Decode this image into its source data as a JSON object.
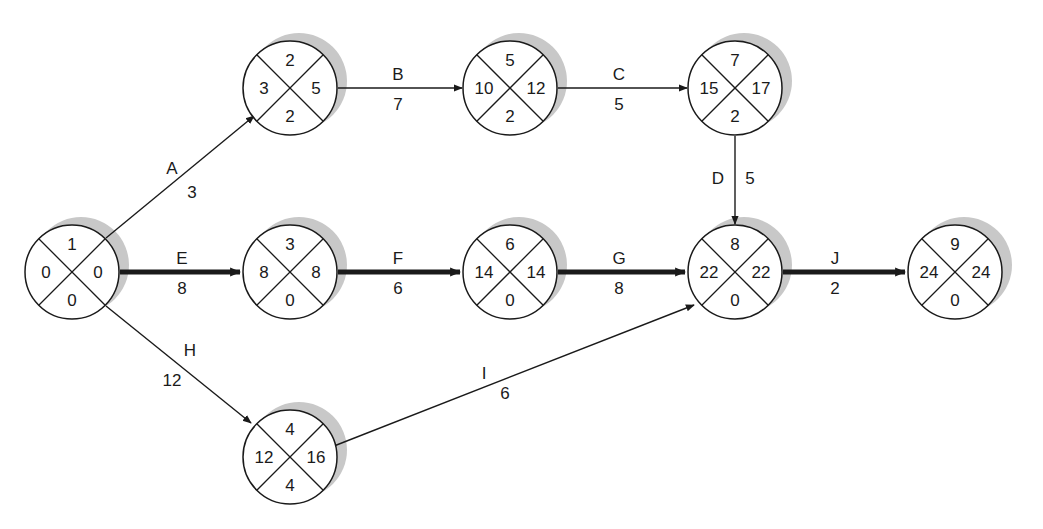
{
  "diagram": {
    "type": "activity-on-arrow network (critical path)",
    "colors": {
      "stroke": "#1a1a1a",
      "shadow": "#c8c8c8",
      "fill": "#ffffff"
    },
    "node_radius": 47,
    "nodes": [
      {
        "id": "1",
        "cx": 72,
        "cy": 272,
        "top": "1",
        "left": "0",
        "right": "0",
        "bottom": "0"
      },
      {
        "id": "2",
        "cx": 290,
        "cy": 88,
        "top": "2",
        "left": "3",
        "right": "5",
        "bottom": "2"
      },
      {
        "id": "5",
        "cx": 510,
        "cy": 88,
        "top": "5",
        "left": "10",
        "right": "12",
        "bottom": "2"
      },
      {
        "id": "7",
        "cx": 735,
        "cy": 88,
        "top": "7",
        "left": "15",
        "right": "17",
        "bottom": "2"
      },
      {
        "id": "3",
        "cx": 290,
        "cy": 272,
        "top": "3",
        "left": "8",
        "right": "8",
        "bottom": "0"
      },
      {
        "id": "6",
        "cx": 510,
        "cy": 272,
        "top": "6",
        "left": "14",
        "right": "14",
        "bottom": "0"
      },
      {
        "id": "8",
        "cx": 735,
        "cy": 272,
        "top": "8",
        "left": "22",
        "right": "22",
        "bottom": "0"
      },
      {
        "id": "9",
        "cx": 955,
        "cy": 272,
        "top": "9",
        "left": "24",
        "right": "24",
        "bottom": "0"
      },
      {
        "id": "4",
        "cx": 290,
        "cy": 457,
        "top": "4",
        "left": "12",
        "right": "16",
        "bottom": "4"
      }
    ],
    "edges": [
      {
        "activity": "A",
        "duration": "3",
        "x1": 106,
        "y1": 238,
        "x2": 254,
        "y2": 116,
        "critical": false,
        "lx": 172,
        "ly": 168,
        "dx": 192,
        "dy": 192
      },
      {
        "activity": "B",
        "duration": "7",
        "x1": 338,
        "y1": 88,
        "x2": 462,
        "y2": 88,
        "critical": false,
        "lx": 398,
        "ly": 74,
        "dx": 398,
        "dy": 104
      },
      {
        "activity": "C",
        "duration": "5",
        "x1": 558,
        "y1": 88,
        "x2": 687,
        "y2": 88,
        "critical": false,
        "lx": 619,
        "ly": 74,
        "dx": 619,
        "dy": 104
      },
      {
        "activity": "D",
        "duration": "5",
        "x1": 735,
        "y1": 136,
        "x2": 735,
        "y2": 224,
        "critical": false,
        "lx": 718,
        "ly": 178,
        "dx": 750,
        "dy": 178
      },
      {
        "activity": "E",
        "duration": "8",
        "x1": 120,
        "y1": 272,
        "x2": 240,
        "y2": 272,
        "critical": true,
        "lx": 182,
        "ly": 258,
        "dx": 182,
        "dy": 288
      },
      {
        "activity": "F",
        "duration": "6",
        "x1": 338,
        "y1": 272,
        "x2": 460,
        "y2": 272,
        "critical": true,
        "lx": 398,
        "ly": 258,
        "dx": 398,
        "dy": 288
      },
      {
        "activity": "G",
        "duration": "8",
        "x1": 558,
        "y1": 272,
        "x2": 685,
        "y2": 272,
        "critical": true,
        "lx": 619,
        "ly": 258,
        "dx": 619,
        "dy": 288
      },
      {
        "activity": "J",
        "duration": "2",
        "x1": 783,
        "y1": 272,
        "x2": 905,
        "y2": 272,
        "critical": true,
        "lx": 835,
        "ly": 258,
        "dx": 835,
        "dy": 288
      },
      {
        "activity": "H",
        "duration": "12",
        "x1": 106,
        "y1": 306,
        "x2": 251,
        "y2": 423,
        "critical": false,
        "lx": 190,
        "ly": 350,
        "dx": 172,
        "dy": 380
      },
      {
        "activity": "I",
        "duration": "6",
        "x1": 334,
        "y1": 446,
        "x2": 694,
        "y2": 305,
        "critical": false,
        "lx": 484,
        "ly": 373,
        "dx": 505,
        "dy": 393
      }
    ]
  }
}
